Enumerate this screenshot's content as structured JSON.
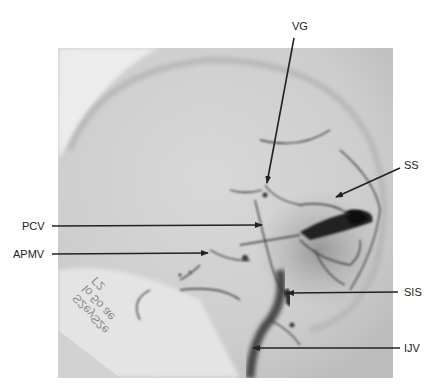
{
  "figure": {
    "type": "lateral cerebral venous angiogram",
    "background_color": "#ffffff",
    "film_color": "#cfcfcf",
    "vessel_color": "#1e1e1e",
    "arrow_color": "#222222"
  },
  "labels": {
    "vg": "VG",
    "ss": "SS",
    "pcv": "PCV",
    "apmv": "APMV",
    "sis": "SIS",
    "ijv": "IJV"
  },
  "annotations": [
    {
      "id": "vg",
      "text": "VG",
      "label_xy": [
        300,
        26
      ],
      "arrow_from": [
        294,
        38
      ],
      "arrow_to": [
        267,
        183
      ]
    },
    {
      "id": "ss",
      "text": "SS",
      "label_xy": [
        415,
        165
      ],
      "arrow_from": [
        400,
        168
      ],
      "arrow_to": [
        336,
        198
      ]
    },
    {
      "id": "pcv",
      "text": "PCV",
      "label_xy": [
        36,
        227
      ],
      "arrow_from": [
        52,
        227
      ],
      "arrow_to": [
        262,
        225
      ]
    },
    {
      "id": "apmv",
      "text": "APMV",
      "label_xy": [
        30,
        255
      ],
      "arrow_from": [
        52,
        255
      ],
      "arrow_to": [
        208,
        253
      ]
    },
    {
      "id": "sis",
      "text": "SIS",
      "label_xy": [
        410,
        292
      ],
      "arrow_from": [
        398,
        292
      ],
      "arrow_to": [
        287,
        293
      ]
    },
    {
      "id": "ijv",
      "text": "IJV",
      "label_xy": [
        413,
        349
      ],
      "arrow_from": [
        400,
        349
      ],
      "arrow_to": [
        253,
        348
      ]
    }
  ],
  "film_text": {
    "line1": "S2eyS2e",
    "line2": "lo 5o ae",
    "line3": "Γ2"
  }
}
